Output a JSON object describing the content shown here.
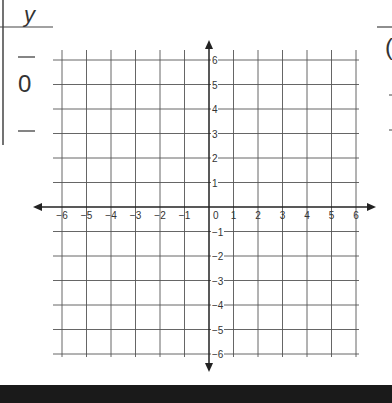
{
  "left_fragment": {
    "header_symbol": "y",
    "value": "0",
    "dash": "—"
  },
  "right_fragment": {
    "partial_glyph": "("
  },
  "chart_data": {
    "type": "scatter",
    "title": "",
    "xlabel": "",
    "ylabel": "",
    "xlim": [
      -6,
      6
    ],
    "ylim": [
      -6,
      6
    ],
    "grid": true,
    "x_ticks": [
      "-6",
      "-5",
      "-4",
      "-3",
      "-2",
      "-1",
      "0",
      "1",
      "2",
      "3",
      "4",
      "5",
      "6"
    ],
    "y_ticks": [
      "6",
      "5",
      "4",
      "3",
      "2",
      "1",
      "-1",
      "-2",
      "-3",
      "-4",
      "-5",
      "-6"
    ],
    "series": [],
    "axis_arrows": true,
    "legend": null
  },
  "colors": {
    "grid": "#555555",
    "axis": "#222222",
    "text": "#333333",
    "bottom_bar": "#1a1a1a"
  }
}
